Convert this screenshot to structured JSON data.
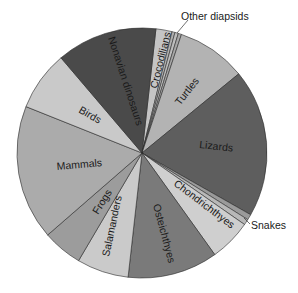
{
  "chart_data": {
    "type": "pie",
    "title": "",
    "units": "degrees of circle (estimated)",
    "center": [
      142,
      153
    ],
    "radius": 125,
    "start_angle_deg": 6.4,
    "slices": [
      {
        "name": "Crocodilians",
        "degrees": 7.5,
        "color": "#c4c4c4",
        "label_inside": true
      },
      {
        "name": "Other diapsids a",
        "degrees": 1.4,
        "color": "#b0b0b0",
        "label_inside": false
      },
      {
        "name": "Other diapsids b",
        "degrees": 1.6,
        "color": "#bdbdbd",
        "label_inside": false
      },
      {
        "name": "Other diapsids c",
        "degrees": 1.5,
        "color": "#a8a8a8",
        "label_inside": false
      },
      {
        "name": "Turtles",
        "degrees": 32.3,
        "color": "#b3b3b3",
        "label_inside": true
      },
      {
        "name": "Lizards",
        "degrees": 68.9,
        "color": "#5e5e5e",
        "label_inside": true
      },
      {
        "name": "Snakes",
        "degrees": 2.6,
        "color": "#9a9a9a",
        "label_inside": false
      },
      {
        "name": "Snakes b",
        "degrees": 2.7,
        "color": "#b8b8b8",
        "label_inside": false
      },
      {
        "name": "Chondrichthyes",
        "degrees": 19.5,
        "color": "#cfcfcf",
        "label_inside": true
      },
      {
        "name": "Osteichthyes",
        "degrees": 42.0,
        "color": "#7a7a7a",
        "label_inside": true
      },
      {
        "name": "Salamanders",
        "degrees": 24.1,
        "color": "#cacaca",
        "label_inside": true
      },
      {
        "name": "Frogs",
        "degrees": 18.5,
        "color": "#9c9c9c",
        "label_inside": true
      },
      {
        "name": "Mammals",
        "degrees": 62.8,
        "color": "#ababab",
        "label_inside": true
      },
      {
        "name": "Birds",
        "degrees": 27.8,
        "color": "#c9c9c9",
        "label_inside": true
      },
      {
        "name": "Nonavian dinosaurs",
        "degrees": 46.8,
        "color": "#4a4a4a",
        "label_inside": true
      }
    ],
    "labels": {
      "nonavian": "Nonavian dinosaurs",
      "crocodilians": "Crocodilians",
      "other_diapsids": "Other diapsids",
      "turtles": "Turtles",
      "lizards": "Lizards",
      "snakes": "Snakes",
      "chondrichthyes": "Chondrichthyes",
      "osteichthyes": "Osteichthyes",
      "salamanders": "Salamanders",
      "frogs": "Frogs",
      "mammals": "Mammals",
      "birds": "Birds"
    },
    "legend": "none (direct labels)",
    "grid": false
  }
}
